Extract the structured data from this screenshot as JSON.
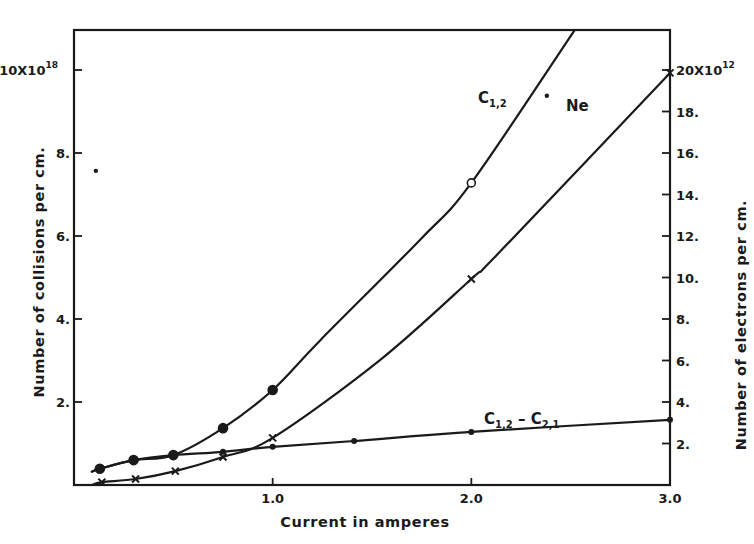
{
  "chart_data": {
    "type": "line",
    "title": "",
    "xlabel": "Current in amperes",
    "ylabel_left": "Number of collisions per cm.",
    "ylabel_right": "Number of electrons per cm.",
    "xlim": [
      0,
      3.0
    ],
    "ylim_left": [
      0,
      11
    ],
    "ylim_right": [
      0,
      22
    ],
    "grid": false,
    "x_ticks": [
      {
        "value": 1.0,
        "label": "1.0"
      },
      {
        "value": 2.0,
        "label": "2.0"
      },
      {
        "value": 3.0,
        "label": "3.0"
      }
    ],
    "y_left_ticks": [
      {
        "value": 2,
        "label": "2."
      },
      {
        "value": 4,
        "label": "4."
      },
      {
        "value": 6,
        "label": "6."
      },
      {
        "value": 8,
        "label": "8."
      },
      {
        "value": 10,
        "label": "10X10",
        "exponent": "18"
      }
    ],
    "y_right_ticks": [
      {
        "value": 2,
        "label": "2."
      },
      {
        "value": 4,
        "label": "4."
      },
      {
        "value": 6,
        "label": "6."
      },
      {
        "value": 8,
        "label": "8."
      },
      {
        "value": 10,
        "label": "10."
      },
      {
        "value": 12,
        "label": "12."
      },
      {
        "value": 14,
        "label": "14."
      },
      {
        "value": 16,
        "label": "16."
      },
      {
        "value": 18,
        "label": "18."
      },
      {
        "value": 20,
        "label": "20X10",
        "exponent": "12"
      }
    ],
    "series": [
      {
        "name": "C1,2",
        "label_main": "C",
        "label_sub": "1,2",
        "axis": "left",
        "units": "x10^18 collisions per cm",
        "marker": "circle",
        "data": [
          [
            0.13,
            0.39
          ],
          [
            0.3,
            0.6
          ],
          [
            0.5,
            0.72
          ],
          [
            0.75,
            1.37
          ],
          [
            1.0,
            2.29
          ],
          [
            2.0,
            7.28
          ]
        ],
        "curve": [
          [
            0.09,
            0.32
          ],
          [
            0.13,
            0.39
          ],
          [
            0.3,
            0.6
          ],
          [
            0.5,
            0.72
          ],
          [
            0.75,
            1.37
          ],
          [
            1.0,
            2.29
          ],
          [
            1.24,
            3.49
          ],
          [
            1.74,
            5.9
          ],
          [
            2.0,
            7.28
          ],
          [
            2.52,
            10.96
          ]
        ]
      },
      {
        "name": "Ne",
        "label_main": "Ne",
        "label_sub": "",
        "axis": "right",
        "units": "x10^12 electrons per cm",
        "marker": "cross",
        "data": [
          [
            0.14,
            0.14
          ],
          [
            0.31,
            0.29
          ],
          [
            0.51,
            0.67
          ],
          [
            0.75,
            1.35
          ],
          [
            1.0,
            2.27
          ],
          [
            2.0,
            9.93
          ],
          [
            3.0,
            19.86
          ]
        ],
        "curve": [
          [
            0.09,
            0.0
          ],
          [
            0.14,
            0.14
          ],
          [
            0.31,
            0.29
          ],
          [
            0.51,
            0.67
          ],
          [
            0.75,
            1.35
          ],
          [
            1.0,
            2.27
          ],
          [
            1.54,
            6.02
          ],
          [
            2.0,
            9.93
          ],
          [
            2.14,
            11.2
          ],
          [
            3.0,
            19.86
          ]
        ]
      },
      {
        "name": "C1,2 - C2,1",
        "label_main": "C",
        "label_sub": "1,2",
        "label_mid": " – C",
        "label_sub2": "2,1",
        "axis": "left",
        "units": "x10^18 collisions per cm",
        "marker": "dot",
        "data": [
          [
            0.75,
            0.8
          ],
          [
            1.0,
            0.92
          ],
          [
            1.41,
            1.06
          ],
          [
            2.0,
            1.28
          ],
          [
            3.0,
            1.57
          ]
        ],
        "curve": [
          [
            0.09,
            0.32
          ],
          [
            0.13,
            0.39
          ],
          [
            0.3,
            0.6
          ],
          [
            0.5,
            0.72
          ],
          [
            0.75,
            0.8
          ],
          [
            1.0,
            0.92
          ],
          [
            1.41,
            1.06
          ],
          [
            2.0,
            1.28
          ],
          [
            3.0,
            1.57
          ]
        ]
      }
    ],
    "stray_points": [
      {
        "axis": "left",
        "x": 0.11,
        "y": 7.57
      },
      {
        "axis": "left",
        "x": 2.38,
        "y": 9.38
      }
    ],
    "annotations": [
      {
        "text": "C1,2",
        "near_series": "C1,2"
      },
      {
        "text": "Ne",
        "near_series": "Ne"
      },
      {
        "text": "C1,2 - C2,1",
        "near_series": "C1,2 - C2,1"
      }
    ]
  },
  "labels": {
    "x_title": "Current in amperes",
    "y_left_title": "Number of collisions per cm.",
    "y_right_title": "Number of electrons per cm.",
    "c12_main": "C",
    "c12_sub": "1,2",
    "ne": "Ne",
    "diff_main": "C",
    "diff_sub1": "1,2",
    "diff_mid": " – C",
    "diff_sub2": "2,1"
  }
}
